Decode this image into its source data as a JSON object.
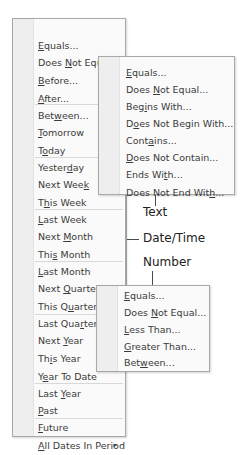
{
  "main_menu": {
    "items": [
      {
        "pre": "",
        "key": "E",
        "post": "quals...",
        "y": 19
      },
      {
        "pre": "Does ",
        "key": "N",
        "post": "ot Equal...",
        "y": 36
      },
      {
        "pre": "",
        "key": "B",
        "post": "efore...",
        "y": 54
      },
      {
        "pre": "",
        "key": "A",
        "post": "fter...",
        "y": 72
      },
      {
        "pre": "Bet",
        "key": "w",
        "post": "een...",
        "y": 89
      },
      {
        "pre": "",
        "key": "T",
        "post": "omorrow",
        "y": 106
      },
      {
        "pre": "T",
        "key": "o",
        "post": "day",
        "y": 124
      },
      {
        "pre": "Yester",
        "key": "d",
        "post": "ay",
        "y": 141
      },
      {
        "pre": "Next Wee",
        "key": "k",
        "post": "",
        "y": 158
      },
      {
        "pre": "T",
        "key": "h",
        "post": "is Week",
        "y": 176
      },
      {
        "pre": "",
        "key": "L",
        "post": "ast Week",
        "y": 193
      },
      {
        "pre": "Next ",
        "key": "M",
        "post": "onth",
        "y": 210
      },
      {
        "pre": "Thi",
        "key": "s",
        "post": " Month",
        "y": 228
      },
      {
        "pre": "",
        "key": "L",
        "post": "ast Month",
        "y": 245
      },
      {
        "pre": "Next ",
        "key": "Q",
        "post": "uarter",
        "y": 262
      },
      {
        "pre": "This Q",
        "key": "u",
        "post": "arter",
        "y": 280
      },
      {
        "pre": "Last Qua",
        "key": "r",
        "post": "ter",
        "y": 297
      },
      {
        "pre": "Next ",
        "key": "Y",
        "post": "ear",
        "y": 314
      },
      {
        "pre": "Th",
        "key": "i",
        "post": "s Year",
        "y": 332
      },
      {
        "pre": "Y",
        "key": "e",
        "post": "ar To Date",
        "y": 350
      },
      {
        "pre": "Last ",
        "key": "Y",
        "post": "ear",
        "y": 367
      },
      {
        "pre": "",
        "key": "P",
        "post": "ast",
        "y": 384
      },
      {
        "pre": "",
        "key": "F",
        "post": "uture",
        "y": 401
      },
      {
        "pre": "",
        "key": "A",
        "post": "ll Dates In Period",
        "y": 419,
        "submenu": true
      }
    ],
    "separators": [
      104,
      157,
      209,
      261,
      314,
      383,
      418
    ],
    "submenu_arrow": "▸"
  },
  "text_menu": {
    "items": [
      {
        "pre": "",
        "key": "E",
        "post": "quals...",
        "y": 8
      },
      {
        "pre": "Does ",
        "key": "N",
        "post": "ot Equal...",
        "y": 25
      },
      {
        "pre": "Beg",
        "key": "i",
        "post": "ns With...",
        "y": 42
      },
      {
        "pre": "D",
        "key": "o",
        "post": "es Not Begin With...",
        "y": 59
      },
      {
        "pre": "Cont",
        "key": "a",
        "post": "ins...",
        "y": 76
      },
      {
        "pre": "",
        "key": "D",
        "post": "oes Not Contain...",
        "y": 93
      },
      {
        "pre": "Ends Wi",
        "key": "t",
        "post": "h...",
        "y": 110
      },
      {
        "pre": "Does Not End Wit",
        "key": "h",
        "post": "...",
        "y": 128
      }
    ]
  },
  "number_menu": {
    "items": [
      {
        "pre": "",
        "key": "E",
        "post": "quals...",
        "y": 2
      },
      {
        "pre": "Does ",
        "key": "N",
        "post": "ot Equal...",
        "y": 19
      },
      {
        "pre": "",
        "key": "L",
        "post": "ess Than...",
        "y": 36
      },
      {
        "pre": "",
        "key": "G",
        "post": "reater Than...",
        "y": 53
      },
      {
        "pre": "Bet",
        "key": "w",
        "post": "een...",
        "y": 69
      }
    ]
  },
  "callouts": {
    "text": "Text",
    "datetime": "Date/Time",
    "number": "Number"
  }
}
